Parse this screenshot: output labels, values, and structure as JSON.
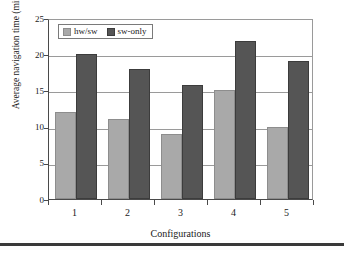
{
  "chart_data": {
    "type": "bar",
    "title": "",
    "xlabel": "Configurations",
    "ylabel": "Average navigation time (min)",
    "categories": [
      "1",
      "2",
      "3",
      "4",
      "5"
    ],
    "series": [
      {
        "name": "hw/sw",
        "color": "#a9a9a9",
        "values": [
          12,
          11,
          9,
          15,
          10
        ]
      },
      {
        "name": "sw-only",
        "color": "#555555",
        "values": [
          20,
          18,
          15.8,
          21.8,
          19
        ]
      }
    ],
    "ylim": [
      0,
      25
    ],
    "ytick_values": [
      0,
      5,
      10,
      15,
      20,
      25
    ],
    "ytick_labels": [
      "0",
      "5",
      "10",
      "15",
      "20",
      "25"
    ],
    "grid": true,
    "grid_axis": "y",
    "legend_position": "upper left",
    "legend_inside_plot": true
  },
  "figure": {
    "background": "#ffffff",
    "axis_color": "#4a4a4a",
    "grid_color": "#9a9a9a",
    "bottom_rule_color": "#3a3a3a"
  }
}
